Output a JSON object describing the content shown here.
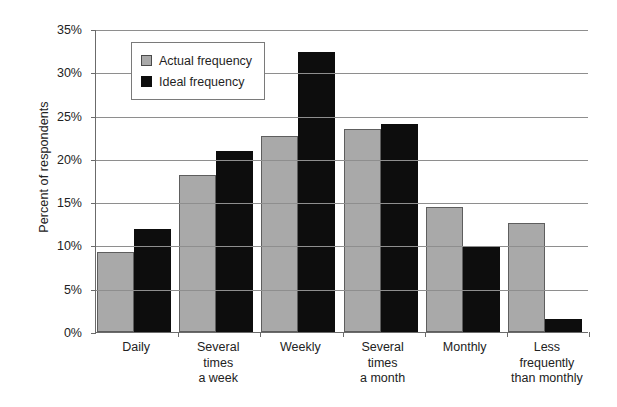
{
  "chart_data": {
    "type": "bar",
    "title": "",
    "xlabel": "",
    "ylabel": "Percent of respondents",
    "ylim": [
      0,
      35
    ],
    "ytick_labels": [
      "0%",
      "5%",
      "10%",
      "15%",
      "20%",
      "25%",
      "30%",
      "35%"
    ],
    "ytick_values": [
      0,
      5,
      10,
      15,
      20,
      25,
      30,
      35
    ],
    "grid": true,
    "legend_position": "upper-left-inside",
    "categories": [
      "Daily",
      "Several times a week",
      "Weekly",
      "Several times a month",
      "Monthly",
      "Less frequently than monthly"
    ],
    "category_label_lines": [
      [
        "Daily"
      ],
      [
        "Several",
        "times",
        "a week"
      ],
      [
        "Weekly"
      ],
      [
        "Several",
        "times",
        "a month"
      ],
      [
        "Monthly"
      ],
      [
        "Less",
        "frequently",
        "than monthly"
      ]
    ],
    "series": [
      {
        "name": "Actual frequency",
        "color": "#a9a9a9",
        "values": [
          9.2,
          18.1,
          22.6,
          23.5,
          14.4,
          12.6
        ]
      },
      {
        "name": "Ideal frequency",
        "color": "#0d0d0d",
        "values": [
          11.9,
          20.9,
          32.3,
          24.0,
          9.8,
          1.5
        ]
      }
    ]
  },
  "legend": {
    "items": [
      {
        "label": "Actual frequency",
        "swatch": "actual-swatch"
      },
      {
        "label": "Ideal frequency",
        "swatch": "ideal-swatch"
      }
    ]
  },
  "axes": {
    "y_title": "Percent of respondents"
  }
}
